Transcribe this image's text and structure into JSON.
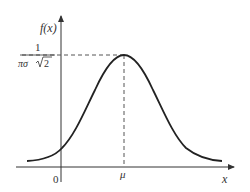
{
  "diagram": {
    "y_axis_label": "f(x)",
    "x_axis_label": "x",
    "origin_label": "0",
    "mean_label": "μ",
    "peak_value": {
      "numerator": "1",
      "denominator_prefix": "πσ",
      "denominator_root": "2"
    },
    "colors": {
      "curve": "#222222",
      "axes": "#333333",
      "dashed": "#555555"
    }
  }
}
